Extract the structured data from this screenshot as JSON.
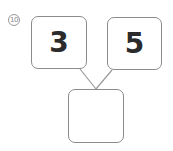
{
  "problem": {
    "number_label": "10",
    "left_value": "3",
    "right_value": "5",
    "answer_value": ""
  }
}
